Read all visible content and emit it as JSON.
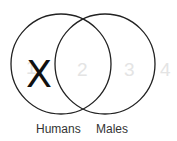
{
  "diagram": {
    "type": "venn",
    "sets": [
      {
        "label": "Humans"
      },
      {
        "label": "Males"
      }
    ],
    "regions": [
      {
        "number": "1",
        "mark": "X"
      },
      {
        "number": "2"
      },
      {
        "number": "3"
      },
      {
        "number": "4"
      }
    ],
    "colors": {
      "outline": "#222222",
      "region_number": "#e4e4e4",
      "mark": "#111111"
    }
  }
}
